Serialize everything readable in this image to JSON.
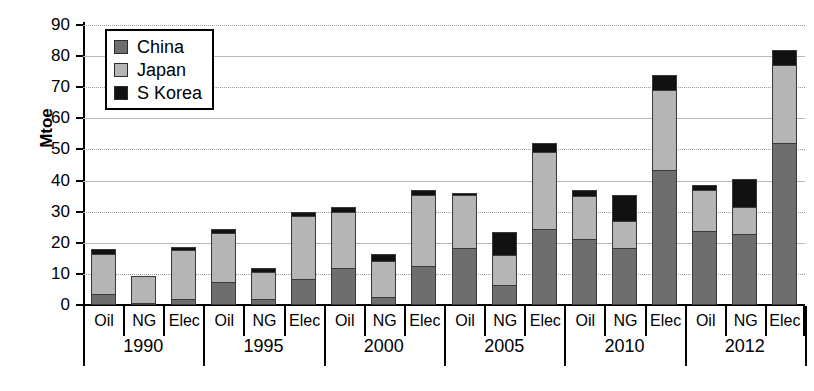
{
  "chart_data": {
    "type": "bar",
    "title": "",
    "subtitle": "",
    "xlabel": "",
    "ylabel": "Mtoe",
    "ylim": [
      0,
      90
    ],
    "ytick_values": [
      0,
      10,
      20,
      30,
      40,
      50,
      60,
      70,
      80,
      90
    ],
    "ytick_labels": [
      "0",
      "10",
      "20",
      "30",
      "40",
      "50",
      "60",
      "70",
      "80",
      "90"
    ],
    "grid": true,
    "stacked": true,
    "legend_position": "top-left",
    "legend_entries": [
      "China",
      "Japan",
      "S Korea"
    ],
    "series_colors": {
      "China": "#6e6e6e",
      "Japan": "#b5b5b5",
      "S Korea": "#111111"
    },
    "groups": [
      "1990",
      "1995",
      "2000",
      "2005",
      "2010",
      "2012"
    ],
    "categories": [
      "Oil",
      "NG",
      "Elec",
      "Oil",
      "NG",
      "Elec",
      "Oil",
      "NG",
      "Elec",
      "Oil",
      "NG",
      "Elec",
      "Oil",
      "NG",
      "Elec",
      "Oil",
      "NG",
      "Elec"
    ],
    "series": [
      {
        "name": "China",
        "values": [
          3.0,
          0.0,
          1.5,
          7.0,
          1.5,
          8.0,
          11.5,
          2.0,
          12.0,
          18.0,
          6.0,
          24.0,
          21.0,
          18.0,
          43.0,
          23.5,
          22.5,
          52.0
        ]
      },
      {
        "name": "Japan",
        "values": [
          13.5,
          9.3,
          16.0,
          16.0,
          9.0,
          20.5,
          18.5,
          12.0,
          23.5,
          17.5,
          10.0,
          25.0,
          14.0,
          9.0,
          26.0,
          13.5,
          9.0,
          25.0
        ]
      },
      {
        "name": "S Korea",
        "values": [
          1.5,
          0.0,
          1.0,
          1.5,
          1.5,
          1.5,
          1.5,
          2.5,
          1.5,
          0.5,
          7.5,
          3.0,
          2.0,
          8.5,
          5.0,
          1.5,
          9.0,
          5.0
        ]
      }
    ],
    "totals": [
      18.0,
      9.3,
      18.5,
      24.5,
      12.0,
      30.0,
      31.5,
      16.5,
      37.0,
      36.0,
      23.5,
      52.0,
      37.0,
      35.5,
      74.0,
      38.5,
      40.5,
      82.0
    ]
  },
  "legend": {
    "items": [
      {
        "label": "China",
        "swatch": "legend-swatch-china"
      },
      {
        "label": "Japan",
        "swatch": "legend-swatch-japan"
      },
      {
        "label": "S Korea",
        "swatch": "legend-swatch-skorea"
      }
    ]
  },
  "axis": {
    "y_title": "Mtoe"
  }
}
